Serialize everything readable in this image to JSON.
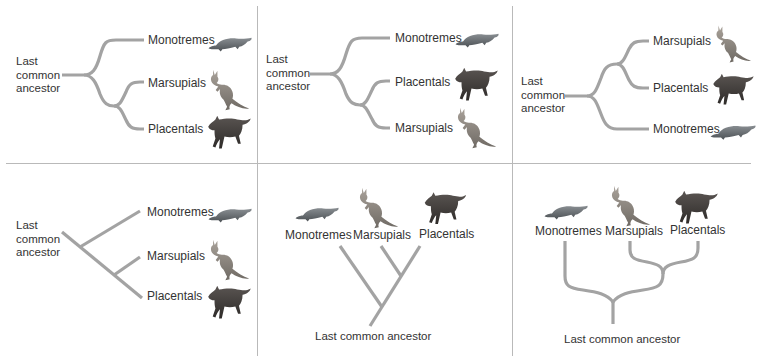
{
  "figure": {
    "branch_color": "#a3a3a3",
    "divider_color": "#b9b9b9",
    "ancestor_label": "Last common ancestor",
    "ancestor_label_lines": [
      "Last",
      "common",
      "ancestor"
    ],
    "panels": [
      {
        "id": "top-left",
        "orientation": "horizontal-curved",
        "tips": [
          "Monotremes",
          "Marsupials",
          "Placentals"
        ],
        "topology": "(Monotremes,(Marsupials,Placentals))"
      },
      {
        "id": "top-middle",
        "orientation": "horizontal-curved",
        "tips": [
          "Monotremes",
          "Placentals",
          "Marsupials"
        ],
        "topology": "(Monotremes,(Placentals,Marsupials))"
      },
      {
        "id": "top-right",
        "orientation": "horizontal-curved",
        "tips": [
          "Marsupials",
          "Placentals",
          "Monotremes"
        ],
        "topology": "((Marsupials,Placentals),Monotremes)"
      },
      {
        "id": "bottom-left",
        "orientation": "horizontal-diagonal",
        "tips": [
          "Monotremes",
          "Marsupials",
          "Placentals"
        ],
        "topology": "(Monotremes,(Marsupials,Placentals))"
      },
      {
        "id": "bottom-middle",
        "orientation": "vertical-diagonal",
        "tips": [
          "Monotremes",
          "Marsupials",
          "Placentals"
        ],
        "topology": "(Monotremes,(Marsupials,Placentals))"
      },
      {
        "id": "bottom-right",
        "orientation": "vertical-curved",
        "tips": [
          "Monotremes",
          "Marsupials",
          "Placentals"
        ],
        "topology": "(Monotremes,(Marsupials,Placentals))"
      }
    ],
    "icons": {
      "Monotremes": "platypus-icon",
      "Marsupials": "kangaroo-icon",
      "Placentals": "wolf-icon"
    }
  }
}
